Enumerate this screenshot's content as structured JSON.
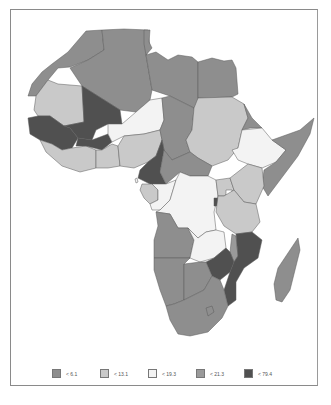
{
  "legend": {
    "items": [
      {
        "label": "< 6.1",
        "color": "#8e8e8e"
      },
      {
        "label": "< 13.1",
        "color": "#c9c9c9"
      },
      {
        "label": "< 19.3",
        "color": "#f3f3f3"
      },
      {
        "label": "< 21.3",
        "color": "#9a9a9a"
      },
      {
        "label": "< 79.4",
        "color": "#505050"
      }
    ]
  },
  "map": {
    "region": "Africa",
    "class_colors": {
      "c1": "#8e8e8e",
      "c2": "#c9c9c9",
      "c3": "#f3f3f3",
      "c4": "#9a9a9a",
      "c5": "#505050"
    }
  }
}
